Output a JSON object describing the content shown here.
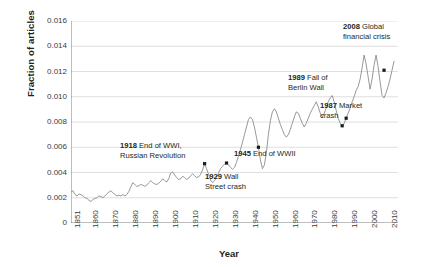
{
  "chart_data": {
    "type": "line",
    "title": "",
    "xlabel": "Year",
    "ylabel": "Fraction of articles",
    "xlim": [
      1851,
      2015
    ],
    "ylim": [
      0,
      0.016
    ],
    "grid": true,
    "legend": "none",
    "line_color": "#8c8c8c",
    "marker_color": "#1a1a1a",
    "ytick_labels": [
      "0.016",
      "0.014",
      "0.012",
      "0.010",
      "0.008",
      "0.006",
      "0.004",
      "0.002",
      "0"
    ],
    "ytick_values": [
      0.016,
      0.014,
      0.012,
      0.01,
      0.008,
      0.006,
      0.004,
      0.002,
      0
    ],
    "xtick_labels": [
      "1851",
      "1860",
      "1870",
      "1880",
      "1890",
      "1900",
      "1910",
      "1920",
      "1930",
      "1940",
      "1950",
      "1960",
      "1970",
      "1980",
      "1990",
      "2000",
      "2010"
    ],
    "xtick_values": [
      1851,
      1860,
      1870,
      1880,
      1890,
      1900,
      1910,
      1920,
      1930,
      1940,
      1950,
      1960,
      1970,
      1980,
      1990,
      2000,
      2010
    ],
    "x": [
      1851,
      1852,
      1853,
      1854,
      1855,
      1856,
      1857,
      1858,
      1859,
      1860,
      1861,
      1862,
      1863,
      1864,
      1865,
      1866,
      1867,
      1868,
      1869,
      1870,
      1871,
      1872,
      1873,
      1874,
      1875,
      1876,
      1877,
      1878,
      1879,
      1880,
      1881,
      1882,
      1883,
      1884,
      1885,
      1886,
      1887,
      1888,
      1889,
      1890,
      1891,
      1892,
      1893,
      1894,
      1895,
      1896,
      1897,
      1898,
      1899,
      1900,
      1901,
      1902,
      1903,
      1904,
      1905,
      1906,
      1907,
      1908,
      1909,
      1910,
      1911,
      1912,
      1913,
      1914,
      1915,
      1916,
      1917,
      1918,
      1919,
      1920,
      1921,
      1922,
      1923,
      1924,
      1925,
      1926,
      1927,
      1928,
      1929,
      1930,
      1931,
      1932,
      1933,
      1934,
      1935,
      1936,
      1937,
      1938,
      1939,
      1940,
      1941,
      1942,
      1943,
      1944,
      1945,
      1946,
      1947,
      1948,
      1949,
      1950,
      1951,
      1952,
      1953,
      1954,
      1955,
      1956,
      1957,
      1958,
      1959,
      1960,
      1961,
      1962,
      1963,
      1964,
      1965,
      1966,
      1967,
      1968,
      1969,
      1970,
      1971,
      1972,
      1973,
      1974,
      1975,
      1976,
      1977,
      1978,
      1979,
      1980,
      1981,
      1982,
      1983,
      1984,
      1985,
      1986,
      1987,
      1988,
      1989,
      1990,
      1991,
      1992,
      1993,
      1994,
      1995,
      1996,
      1997,
      1998,
      1999,
      2000,
      2001,
      2002,
      2003,
      2004,
      2005,
      2006,
      2007,
      2008,
      2009,
      2010,
      2011,
      2012,
      2013
    ],
    "y": [
      0.00245,
      0.00255,
      0.00225,
      0.00215,
      0.0023,
      0.00225,
      0.00215,
      0.002,
      0.00195,
      0.0018,
      0.0017,
      0.00185,
      0.00195,
      0.002,
      0.00215,
      0.0021,
      0.002,
      0.00215,
      0.0023,
      0.00245,
      0.00255,
      0.0024,
      0.00225,
      0.00215,
      0.0022,
      0.00215,
      0.00225,
      0.00215,
      0.00225,
      0.0025,
      0.00285,
      0.0032,
      0.00305,
      0.0029,
      0.00295,
      0.00305,
      0.003,
      0.0029,
      0.003,
      0.0032,
      0.00335,
      0.0032,
      0.0031,
      0.00305,
      0.00315,
      0.0033,
      0.0035,
      0.00335,
      0.00325,
      0.0035,
      0.00395,
      0.00405,
      0.0038,
      0.0036,
      0.00345,
      0.0035,
      0.0037,
      0.0036,
      0.00345,
      0.00355,
      0.00375,
      0.0039,
      0.00375,
      0.0036,
      0.00365,
      0.00385,
      0.0042,
      0.0047,
      0.0043,
      0.00385,
      0.0034,
      0.0032,
      0.00335,
      0.0036,
      0.00395,
      0.0043,
      0.0045,
      0.00465,
      0.00475,
      0.0046,
      0.0044,
      0.00425,
      0.0044,
      0.0048,
      0.0053,
      0.0058,
      0.0064,
      0.007,
      0.0076,
      0.0082,
      0.0084,
      0.0082,
      0.0076,
      0.0068,
      0.006,
      0.005,
      0.0043,
      0.0046,
      0.0056,
      0.007,
      0.0081,
      0.0088,
      0.00905,
      0.0088,
      0.0083,
      0.0078,
      0.0074,
      0.007,
      0.0068,
      0.007,
      0.0074,
      0.0079,
      0.0084,
      0.0088,
      0.0087,
      0.0083,
      0.0079,
      0.0076,
      0.0079,
      0.0083,
      0.0087,
      0.009,
      0.0093,
      0.0096,
      0.0092,
      0.0087,
      0.0084,
      0.0087,
      0.0091,
      0.0096,
      0.0099,
      0.0101,
      0.0096,
      0.0089,
      0.0083,
      0.0079,
      0.0077,
      0.0079,
      0.0083,
      0.0087,
      0.0091,
      0.0096,
      0.01,
      0.0105,
      0.0108,
      0.0114,
      0.0123,
      0.0133,
      0.0126,
      0.0116,
      0.0106,
      0.0114,
      0.0125,
      0.0133,
      0.0124,
      0.0112,
      0.0101,
      0.0099,
      0.0103,
      0.0108,
      0.0114,
      0.0121,
      0.0128,
      0.0133,
      0.0138,
      0.0142,
      0.0145
    ],
    "annotations": [
      {
        "id": "anno-1918",
        "year": 1918,
        "value": 0.0047,
        "bold": "1918",
        "text": "End of WWI,",
        "text2": "Russian Revolution"
      },
      {
        "id": "anno-1929",
        "year": 1929,
        "value": 0.00475,
        "bold": "1929",
        "text": "Wall",
        "text2": "Street crash"
      },
      {
        "id": "anno-1945",
        "year": 1945,
        "value": 0.006,
        "bold": "1945",
        "text": "End of WWII",
        "text2": ""
      },
      {
        "id": "anno-1987",
        "year": 1987,
        "value": 0.0077,
        "bold": "1987",
        "text": "Market",
        "text2": "crash"
      },
      {
        "id": "anno-1989",
        "year": 1989,
        "value": 0.0083,
        "bold": "1989",
        "text": "Fall of",
        "text2": "Berlin Wall"
      },
      {
        "id": "anno-2008",
        "year": 2008,
        "value": 0.0121,
        "bold": "2008",
        "text": "Global",
        "text2": "financial crisis"
      }
    ]
  }
}
